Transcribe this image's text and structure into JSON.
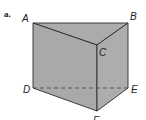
{
  "figure": {
    "part_label": "a.",
    "shape": "triangular-prism",
    "colors": {
      "face": "#ababab",
      "edge": "#2b2b2b",
      "hidden_edge": "#4a4a4a"
    },
    "vertices": {
      "A": {
        "label": "A",
        "x": 33,
        "y": 23
      },
      "B": {
        "label": "B",
        "x": 128,
        "y": 23
      },
      "C": {
        "label": "C",
        "x": 97,
        "y": 45
      },
      "D": {
        "label": "D",
        "x": 33,
        "y": 88
      },
      "E": {
        "label": "E",
        "x": 128,
        "y": 88
      },
      "F": {
        "label": "F",
        "x": 97,
        "y": 111
      }
    },
    "hidden_edges": [
      "DE"
    ]
  }
}
